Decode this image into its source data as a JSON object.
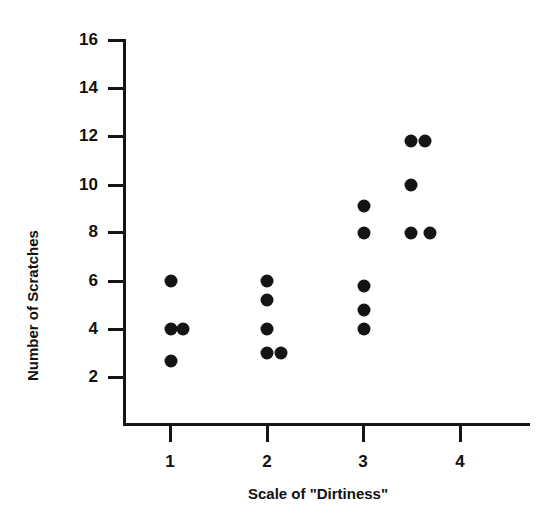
{
  "chart_data": {
    "type": "scatter",
    "title": "",
    "xlabel": "Scale of \"Dirtiness\"",
    "ylabel": "Number of Scratches",
    "xlim": [
      0,
      4.6
    ],
    "ylim": [
      0,
      16
    ],
    "xticks": [
      1,
      2,
      3,
      4
    ],
    "xtick_labels": [
      "1",
      "2",
      "3",
      "4"
    ],
    "yticks": [
      2,
      4,
      6,
      8,
      10,
      12,
      14,
      16
    ],
    "ytick_labels": [
      "2",
      "4",
      "6",
      "8",
      "10",
      "12",
      "14",
      "16"
    ],
    "grid": false,
    "legend": null,
    "marker": {
      "shape": "circle",
      "color": "#151515",
      "size_px": 13
    },
    "points": [
      {
        "x": 1.0,
        "y": 6.0
      },
      {
        "x": 1.0,
        "y": 4.0
      },
      {
        "x": 1.13,
        "y": 4.0
      },
      {
        "x": 1.0,
        "y": 2.7
      },
      {
        "x": 2.0,
        "y": 6.0
      },
      {
        "x": 2.0,
        "y": 5.2
      },
      {
        "x": 2.0,
        "y": 4.0
      },
      {
        "x": 2.0,
        "y": 3.0
      },
      {
        "x": 2.15,
        "y": 3.0
      },
      {
        "x": 3.0,
        "y": 9.1
      },
      {
        "x": 3.0,
        "y": 8.0
      },
      {
        "x": 3.0,
        "y": 5.8
      },
      {
        "x": 3.0,
        "y": 4.8
      },
      {
        "x": 3.0,
        "y": 4.0
      },
      {
        "x": 3.49,
        "y": 11.8
      },
      {
        "x": 3.64,
        "y": 11.8
      },
      {
        "x": 3.49,
        "y": 10.0
      },
      {
        "x": 3.49,
        "y": 8.0
      },
      {
        "x": 3.69,
        "y": 8.0
      }
    ]
  },
  "axes": {
    "axis_color": "#151515",
    "background": "#ffffff"
  }
}
